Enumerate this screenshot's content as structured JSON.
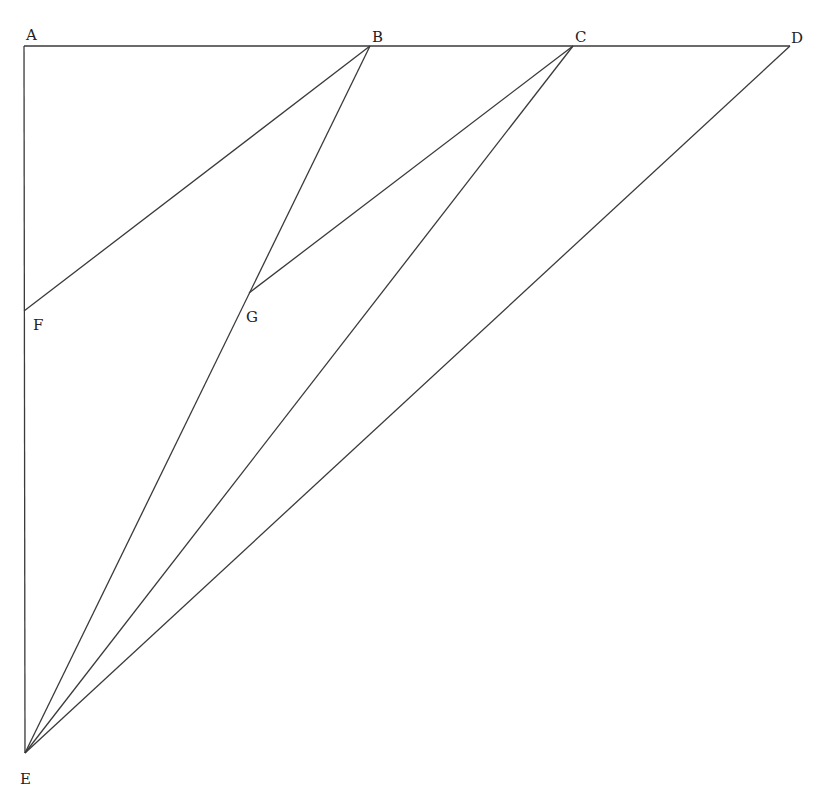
{
  "diagram": {
    "type": "geometry",
    "points": {
      "A": {
        "x": 24,
        "y": 46,
        "label": "A",
        "lx": 26,
        "ly": 40
      },
      "B": {
        "x": 370,
        "y": 46,
        "label": "B",
        "lx": 372,
        "ly": 42
      },
      "C": {
        "x": 573,
        "y": 46,
        "label": "C",
        "lx": 575,
        "ly": 42
      },
      "D": {
        "x": 790,
        "y": 46,
        "label": "D",
        "lx": 791,
        "ly": 43
      },
      "F": {
        "x": 24,
        "y": 311,
        "label": "F",
        "lx": 33,
        "ly": 330
      },
      "G": {
        "x": 249,
        "y": 293,
        "label": "G",
        "lx": 246,
        "ly": 322
      },
      "E": {
        "x": 25,
        "y": 753,
        "label": "E",
        "lx": 20,
        "ly": 784
      }
    },
    "segments": [
      [
        "A",
        "D"
      ],
      [
        "A",
        "E"
      ],
      [
        "F",
        "B"
      ],
      [
        "B",
        "E"
      ],
      [
        "G",
        "C"
      ],
      [
        "C",
        "E"
      ],
      [
        "D",
        "E"
      ]
    ]
  }
}
